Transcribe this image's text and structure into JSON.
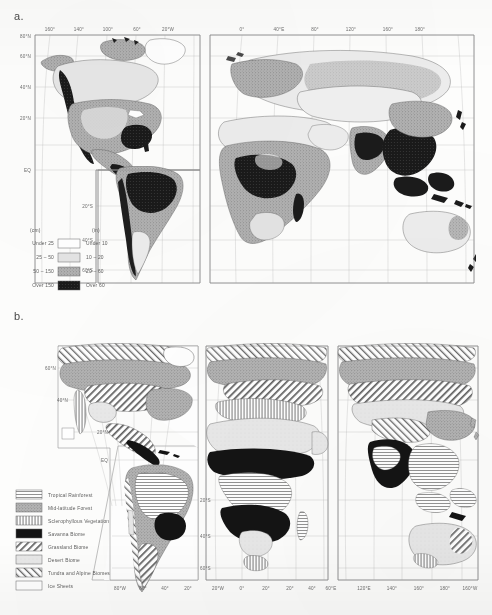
{
  "figure": {
    "panel_a_label": "a.",
    "panel_b_label": "b."
  },
  "map_a": {
    "name": "world-annual-precipitation-map",
    "projection": "interrupted-goode-homolosine",
    "lat_labels_left": [
      "80°N",
      "60°N",
      "40°N",
      "20°N",
      "EQ"
    ],
    "lat_labels_south": [
      "20°S",
      "40°S",
      "60°S"
    ],
    "lon_labels_west": [
      "160°",
      "140°",
      "100°",
      "60°",
      "20°W"
    ],
    "lon_labels_east": [
      "0°",
      "40°E",
      "80°",
      "120°",
      "160°",
      "180°"
    ],
    "legend": {
      "header_metric": "(cm)",
      "header_imperial": "(in)",
      "rows": [
        {
          "metric": "Under 25",
          "imperial": "Under 10",
          "fill": "#ffffff"
        },
        {
          "metric": "25 – 50",
          "imperial": "10 – 20",
          "fill": "#e2e2e2"
        },
        {
          "metric": "50 – 150",
          "imperial": "20 – 60",
          "fill": "#a9a9a9"
        },
        {
          "metric": "Over 150",
          "imperial": "Over 60",
          "fill": "#1d1d1d"
        }
      ]
    }
  },
  "map_b": {
    "name": "world-biomes-map",
    "projection": "interrupted-goode-homolosine",
    "lat_labels_north": [
      "60°N",
      "40°N",
      "20°N"
    ],
    "equator_label": "EQ",
    "lat_labels_south": [
      "20°S",
      "40°S",
      "60°S"
    ],
    "lon_labels_bottom": [
      "80°W",
      "60°",
      "40°",
      "20°",
      "20°W",
      "0°",
      "20°",
      "20°",
      "40°",
      "60°E",
      "120°E",
      "140°",
      "160°",
      "180°",
      "160°W"
    ],
    "legend": {
      "rows": [
        {
          "label": "Tropical Rainforest",
          "pattern": "lines-horizontal-light"
        },
        {
          "label": "Mid-latitude Forest",
          "pattern": "stipple-grey"
        },
        {
          "label": "Sclerophyllous Vegetation",
          "pattern": "lines-vertical"
        },
        {
          "label": "Savanna Biome",
          "pattern": "solid-black"
        },
        {
          "label": "Grassland Biome",
          "pattern": "hatch-forward"
        },
        {
          "label": "Desert Biome",
          "pattern": "light-grey"
        },
        {
          "label": "Tundra and Alpine Biomes",
          "pattern": "hatch-back"
        },
        {
          "label": "Ice Sheets",
          "pattern": "white"
        }
      ]
    }
  },
  "colors": {
    "ink": "#3a3a3a",
    "graticule": "#b9b9b9",
    "frame": "#8d8d8d",
    "paper": "#fdfdfc",
    "tone_light": "#e2e2e2",
    "tone_mid": "#a9a9a9",
    "tone_dark": "#1d1d1d"
  }
}
